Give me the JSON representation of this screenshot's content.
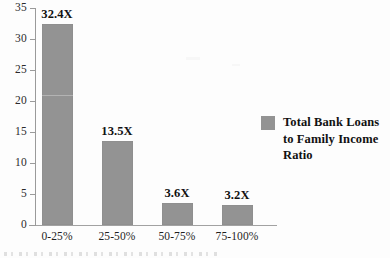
{
  "chart_data": {
    "type": "bar",
    "title": "",
    "xlabel": "",
    "ylabel": "",
    "categories": [
      "0-25%",
      "25-50%",
      "50-75%",
      "75-100%"
    ],
    "values": [
      32.4,
      13.5,
      3.6,
      3.2
    ],
    "data_labels": [
      "32.4X",
      "13.5X",
      "3.6X",
      "3.2X"
    ],
    "ylim": [
      0,
      35
    ],
    "yticks": [
      0,
      5,
      10,
      15,
      20,
      25,
      30,
      35
    ],
    "ytick_labels": [
      "0",
      "5",
      "10",
      "15",
      "20",
      "25",
      "30",
      "35"
    ],
    "grid": false,
    "legend_position": "right",
    "series": [
      {
        "name": "Total Bank Loans to Family Income Ratio",
        "values": [
          32.4,
          13.5,
          3.6,
          3.2
        ],
        "color": "#939393"
      }
    ]
  },
  "legend": {
    "label": "Total Bank Loans\nto Family Income\nRatio",
    "swatch_color": "#939393"
  },
  "colors": {
    "bar": "#939393",
    "axis": "#9a9a9a",
    "text": "#1f1f1f",
    "background": "#fdfdfd"
  }
}
